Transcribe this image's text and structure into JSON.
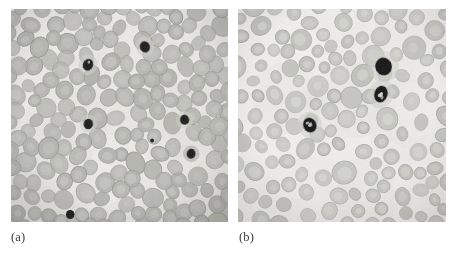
{
  "figure": {
    "type": "micrograph-figure",
    "background_color": "#ffffff",
    "width": 455,
    "height": 255,
    "panel_count": 2
  },
  "panels": [
    {
      "id": "panel-a",
      "caption": "(a)",
      "caption_x": 11,
      "caption_y": 231,
      "x": 11,
      "y": 9,
      "width": 217,
      "height": 213,
      "subject": "blood-smear-micrograph",
      "background_color": "#eceae6",
      "cell_fill": "#b3b3ae",
      "cell_stroke": "#9a9a95",
      "cell_center": "#c6c6c1",
      "nucleus_color": "#1d1d1d",
      "density": "dense-packed",
      "rbc_count": 360,
      "rbc_radius_min": 7.2,
      "rbc_radius_max": 10.4,
      "vignette_opacity": 0.14,
      "grain_opacity": 0.1,
      "seed": 1733,
      "dark_cells": [
        {
          "cx": 0.617,
          "cy": 0.178,
          "rx": 5.0,
          "ry": 5.8,
          "rot": -18,
          "halo": true,
          "lobes": 0
        },
        {
          "cx": 0.355,
          "cy": 0.262,
          "rx": 5.1,
          "ry": 6.0,
          "rot": 24,
          "halo": true,
          "lobes": 1
        },
        {
          "cx": 0.356,
          "cy": 0.54,
          "rx": 4.7,
          "ry": 5.3,
          "rot": 5,
          "halo": true,
          "lobes": 0
        },
        {
          "cx": 0.8,
          "cy": 0.52,
          "rx": 4.6,
          "ry": 5.1,
          "rot": -10,
          "halo": true,
          "lobes": 0
        },
        {
          "cx": 0.83,
          "cy": 0.68,
          "rx": 4.4,
          "ry": 5.0,
          "rot": 12,
          "halo": true,
          "lobes": 0
        },
        {
          "cx": 0.273,
          "cy": 0.965,
          "rx": 4.3,
          "ry": 4.6,
          "rot": 0,
          "halo": false,
          "lobes": 0
        },
        {
          "cx": 0.65,
          "cy": 0.618,
          "rx": 1.9,
          "ry": 2.0,
          "rot": 0,
          "halo": false,
          "lobes": 0
        }
      ]
    },
    {
      "id": "panel-b",
      "caption": "(b)",
      "caption_x": 239,
      "caption_y": 231,
      "x": 238,
      "y": 9,
      "width": 208,
      "height": 213,
      "subject": "blood-smear-micrograph",
      "background_color": "#f1efec",
      "cell_fill": "#c0c0bb",
      "cell_stroke": "#a6a6a1",
      "cell_center": "#d6d6d1",
      "nucleus_color": "#141414",
      "density": "dispersed",
      "rbc_count": 190,
      "rbc_radius_min": 6.0,
      "rbc_radius_max": 11.2,
      "vignette_opacity": 0.1,
      "grain_opacity": 0.09,
      "seed": 4271,
      "dark_cells": [
        {
          "cx": 0.7,
          "cy": 0.27,
          "rx": 8.3,
          "ry": 9.0,
          "rot": -12,
          "halo": true,
          "lobes": 0
        },
        {
          "cx": 0.687,
          "cy": 0.4,
          "rx": 6.6,
          "ry": 8.4,
          "rot": 16,
          "halo": true,
          "lobes": 5
        },
        {
          "cx": 0.345,
          "cy": 0.545,
          "rx": 6.6,
          "ry": 7.6,
          "rot": -24,
          "halo": true,
          "lobes": 4
        }
      ]
    }
  ]
}
